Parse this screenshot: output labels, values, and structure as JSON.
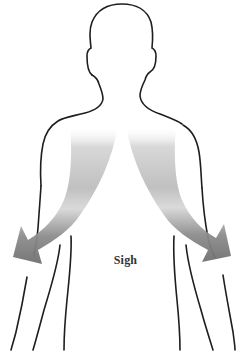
{
  "diagram": {
    "label": "Sigh",
    "colors": {
      "outline": "#1e1e1e",
      "arrow_light": "#f2f2f2",
      "arrow_mid": "#c4c4c4",
      "arrow_dark": "#7a7a7a",
      "label": "#333333",
      "background": "#ffffff"
    },
    "elements": {
      "silhouette": "human-upper-body-outline",
      "arrows": [
        "left-downward-curved-arrow",
        "right-downward-curved-arrow"
      ]
    }
  }
}
